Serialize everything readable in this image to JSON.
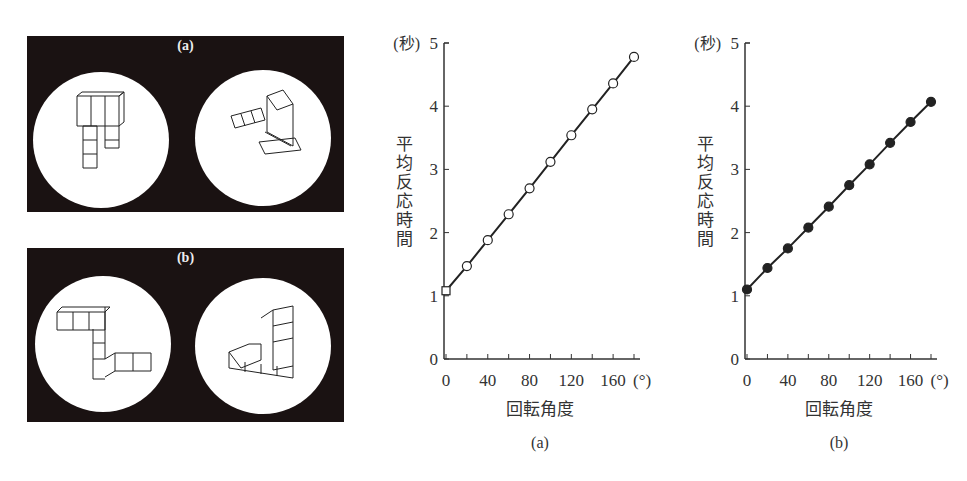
{
  "stimuli": [
    {
      "label": "(a)",
      "description": "Pair of 3D block figures (same object rotated)"
    },
    {
      "label": "(b)",
      "description": "Pair of 3D block figures (same object rotated)"
    }
  ],
  "chart_data": [
    {
      "type": "line",
      "title": "",
      "caption": "(a)",
      "xlabel": "回転角度",
      "x_unit": "(°)",
      "ylabel": "平均反応時間",
      "y_unit": "(秒)",
      "x": [
        0,
        20,
        40,
        60,
        80,
        100,
        120,
        140,
        160,
        180
      ],
      "xticks": [
        "0",
        "40",
        "80",
        "120",
        "160"
      ],
      "yticks": [
        "0",
        "1",
        "2",
        "3",
        "4",
        "5"
      ],
      "xlim": [
        0,
        180
      ],
      "ylim": [
        0,
        5
      ],
      "grid": false,
      "marker": "open-circle",
      "series": [
        {
          "name": "a",
          "values": [
            1.08,
            1.47,
            1.88,
            2.29,
            2.7,
            3.12,
            3.54,
            3.95,
            4.36,
            4.78
          ]
        }
      ]
    },
    {
      "type": "line",
      "title": "",
      "caption": "(b)",
      "xlabel": "回転角度",
      "x_unit": "(°)",
      "ylabel": "平均反応時間",
      "y_unit": "(秒)",
      "x": [
        0,
        20,
        40,
        60,
        80,
        100,
        120,
        140,
        160,
        180
      ],
      "xticks": [
        "0",
        "40",
        "80",
        "120",
        "160"
      ],
      "yticks": [
        "0",
        "1",
        "2",
        "3",
        "4",
        "5"
      ],
      "xlim": [
        0,
        180
      ],
      "ylim": [
        0,
        5
      ],
      "grid": false,
      "marker": "filled-circle",
      "series": [
        {
          "name": "b",
          "values": [
            1.1,
            1.44,
            1.75,
            2.08,
            2.41,
            2.75,
            3.08,
            3.42,
            3.75,
            4.07
          ]
        }
      ]
    }
  ]
}
